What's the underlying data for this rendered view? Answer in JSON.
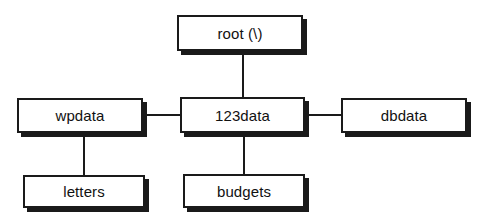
{
  "diagram": {
    "type": "directory-tree",
    "title": "",
    "nodes": [
      {
        "id": "root",
        "label": "root (\\)",
        "x": 177,
        "y": 15,
        "width": 126,
        "height": 36
      },
      {
        "id": "wpdata",
        "label": "wpdata",
        "x": 17,
        "y": 98,
        "width": 126,
        "height": 35
      },
      {
        "id": "123data",
        "label": "123data",
        "x": 180,
        "y": 97,
        "width": 125,
        "height": 36
      },
      {
        "id": "dbdata",
        "label": "dbdata",
        "x": 341,
        "y": 98,
        "width": 126,
        "height": 35
      },
      {
        "id": "letters",
        "label": "letters",
        "x": 23,
        "y": 175,
        "width": 122,
        "height": 33
      },
      {
        "id": "budgets",
        "label": "budgets",
        "x": 183,
        "y": 174,
        "width": 122,
        "height": 34
      }
    ],
    "connectors": [
      {
        "id": "root-to-123data",
        "from": "root",
        "to": "123data",
        "orientation": "v",
        "x": 242,
        "y": 51,
        "length": 46
      },
      {
        "id": "wpdata-to-123data",
        "from": "wpdata",
        "to": "123data",
        "orientation": "h",
        "x": 147,
        "y": 114,
        "length": 33
      },
      {
        "id": "123data-to-dbdata",
        "from": "123data",
        "to": "dbdata",
        "orientation": "h",
        "x": 309,
        "y": 114,
        "length": 32
      },
      {
        "id": "wpdata-to-letters",
        "from": "wpdata",
        "to": "letters",
        "orientation": "v",
        "x": 83,
        "y": 133,
        "length": 42
      },
      {
        "id": "123data-to-budgets",
        "from": "123data",
        "to": "budgets",
        "orientation": "v",
        "x": 243,
        "y": 133,
        "length": 41
      }
    ],
    "colors": {
      "background": "#ffffff",
      "stroke": "#1a1a1a",
      "text": "#111111",
      "shadow": "#1a1a1a"
    }
  }
}
